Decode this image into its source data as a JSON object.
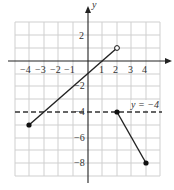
{
  "graph": {
    "axis_labels": {
      "y": "y"
    },
    "x_ticks": [
      {
        "label": "−4",
        "x": 29
      },
      {
        "label": "−3",
        "x": 43
      },
      {
        "label": "−2",
        "x": 58
      },
      {
        "label": "−1",
        "x": 72
      },
      {
        "label": "1",
        "x": 102
      },
      {
        "label": "2",
        "x": 116
      },
      {
        "label": "3",
        "x": 131
      },
      {
        "label": "4",
        "x": 145
      }
    ],
    "y_ticks": [
      {
        "label": "2",
        "y": 35
      },
      {
        "label": "−2",
        "y": 86
      },
      {
        "label": "−4",
        "y": 112
      },
      {
        "label": "−6",
        "y": 138
      },
      {
        "label": "−8",
        "y": 163
      }
    ],
    "asymptote_label": "y = −4",
    "segments": [
      {
        "from": [
          -4,
          -5
        ],
        "to": [
          2,
          1
        ],
        "start": "closed",
        "end": "open"
      },
      {
        "from": [
          2,
          -4
        ],
        "to": [
          4,
          -8
        ],
        "start": "closed",
        "end": "closed"
      }
    ],
    "dashed_line": {
      "y": -4
    },
    "colors": {
      "grid": "#c8c8c8",
      "axis": "#222222",
      "line": "#222222"
    }
  }
}
